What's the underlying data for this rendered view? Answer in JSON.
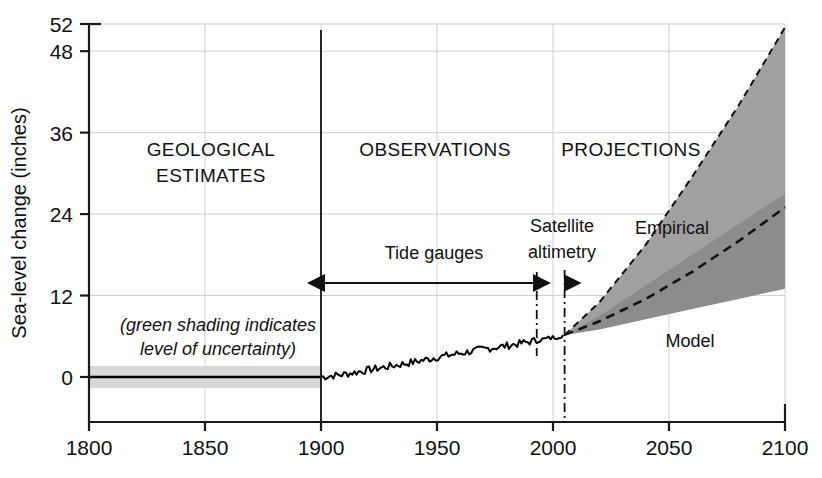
{
  "chart_data": {
    "type": "area",
    "title": "",
    "xlabel": "",
    "ylabel": "Sea-level change (inches)",
    "xlim": [
      1800,
      2100
    ],
    "ylim": [
      -4,
      52
    ],
    "grid": true,
    "legend_position": "inline-annotations",
    "x_ticks": [
      "1800",
      "1850",
      "1900",
      "1950",
      "2000",
      "2050",
      "2100"
    ],
    "x_tick_values": [
      1800,
      1850,
      1900,
      1950,
      2000,
      2050,
      2100
    ],
    "y_ticks": [
      "0",
      "12",
      "24",
      "36",
      "48",
      "52"
    ],
    "y_tick_values": [
      0,
      12,
      24,
      36,
      48,
      52
    ],
    "era_labels": [
      {
        "id": "geological",
        "line1": "GEOLOGICAL",
        "line2": "ESTIMATES",
        "x": 1845,
        "y": 41
      },
      {
        "id": "observations",
        "line1": "OBSERVATIONS",
        "line2": "",
        "x": 1940,
        "y": 41
      },
      {
        "id": "projections",
        "line1": "PROJECTIONS",
        "line2": "",
        "x": 2020,
        "y": 41
      }
    ],
    "annotations": [
      {
        "id": "tide-gauges",
        "label": "Tide gauges",
        "x_start": 1900,
        "x_end": 1993,
        "y": 16
      },
      {
        "id": "satellite-altimetry",
        "line1": "Satellite",
        "line2": "altimetry",
        "x_start": 1993,
        "x_end": 2005,
        "y": 16
      },
      {
        "id": "uncertainty-note",
        "line1": "(green shading indicates",
        "line2": "level of uncertainty)",
        "x": 1830,
        "y": 7
      }
    ],
    "series": [
      {
        "name": "Geological estimates uncertainty band",
        "type": "band",
        "x": [
          1800,
          1900
        ],
        "upper": [
          1.6,
          1.6
        ],
        "lower": [
          -1.6,
          -1.6
        ],
        "color": "#d8d8d8"
      },
      {
        "name": "Geological estimates",
        "type": "line",
        "x": [
          1800,
          1900
        ],
        "values": [
          0,
          0
        ],
        "color": "#000000"
      },
      {
        "name": "Observations (tide gauges + satellite altimetry)",
        "type": "line",
        "x": [
          1900,
          1910,
          1920,
          1930,
          1940,
          1950,
          1960,
          1970,
          1980,
          1990,
          2000,
          2005
        ],
        "values": [
          0.0,
          0.4,
          1.0,
          1.6,
          2.2,
          2.9,
          3.5,
          4.1,
          4.6,
          5.2,
          5.8,
          6.2
        ],
        "color": "#000000"
      },
      {
        "name": "Empirical",
        "type": "band",
        "x": [
          2005,
          2020,
          2040,
          2060,
          2080,
          2100
        ],
        "upper": [
          6.2,
          11.0,
          19.5,
          29.5,
          40.0,
          51.5
        ],
        "lower": [
          6.2,
          8.0,
          11.0,
          14.0,
          17.5,
          21.0
        ],
        "color": "#a0a0a0"
      },
      {
        "name": "Model",
        "type": "band",
        "x": [
          2005,
          2020,
          2040,
          2060,
          2080,
          2100
        ],
        "upper": [
          6.2,
          9.0,
          13.5,
          18.0,
          22.5,
          27.0
        ],
        "lower": [
          6.2,
          7.0,
          8.5,
          10.0,
          11.5,
          13.0
        ],
        "color": "#8c8c8c"
      },
      {
        "name": "Central projection",
        "type": "dashed-line",
        "x": [
          2005,
          2020,
          2040,
          2060,
          2080,
          2100
        ],
        "values": [
          6.2,
          8.2,
          11.5,
          15.5,
          20.0,
          25.0
        ],
        "color": "#000000"
      }
    ],
    "series_labels": [
      {
        "id": "empirical",
        "label": "Empirical",
        "x": 2033,
        "y": 26.5
      },
      {
        "id": "model",
        "label": "Model",
        "x": 2041,
        "y": 7.5
      }
    ],
    "era_dividers": [
      {
        "id": "divider-1900",
        "x": 1900,
        "style": "solid"
      },
      {
        "id": "divider-1993",
        "x": 1993,
        "style": "dash-dot"
      },
      {
        "id": "divider-2005",
        "x": 2005,
        "style": "dash-dot"
      }
    ],
    "colors": {
      "axis": "#1a1a1a",
      "grid": "#d0d0d0",
      "uncertainty_band": "#d8d8d8",
      "empirical_band": "#a3a3a3",
      "model_band": "#8a8a8a",
      "line": "#000000"
    }
  }
}
